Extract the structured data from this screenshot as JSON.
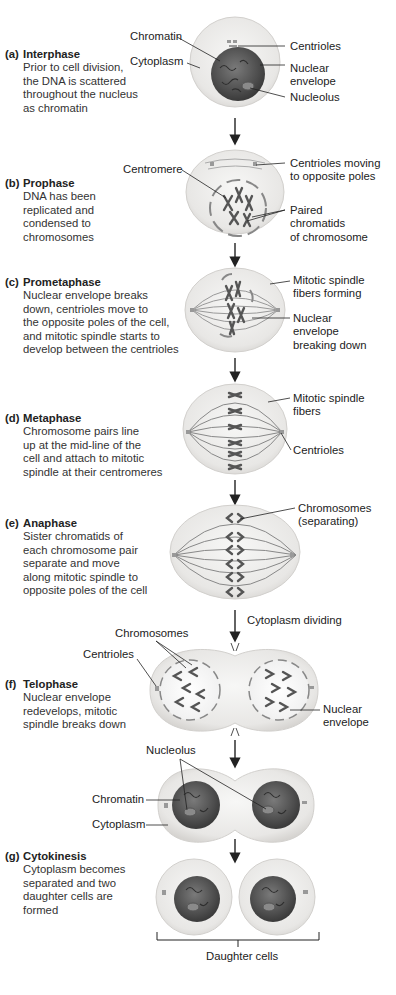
{
  "stages": [
    {
      "letter": "(a)",
      "name": "Interphase",
      "desc": [
        "Prior to cell division,",
        "the DNA is scattered",
        "throughout the nucleus",
        "as chromatin"
      ]
    },
    {
      "letter": "(b)",
      "name": "Prophase",
      "desc": [
        "DNA has been",
        "replicated and",
        "condensed to",
        "chromosomes"
      ]
    },
    {
      "letter": "(c)",
      "name": "Prometaphase",
      "desc": [
        "Nuclear envelope breaks",
        "down, centrioles move to",
        "the opposite poles of the cell,",
        "and mitotic spindle starts to",
        "develop between the centrioles"
      ]
    },
    {
      "letter": "(d)",
      "name": "Metaphase",
      "desc": [
        "Chromosome pairs line",
        "up at the mid-line of the",
        "cell and attach to mitotic",
        "spindle at their centromeres"
      ]
    },
    {
      "letter": "(e)",
      "name": "Anaphase",
      "desc": [
        "Sister chromatids of",
        "each chromosome pair",
        "separate and move",
        "along mitotic spindle to",
        "opposite poles of the cell"
      ]
    },
    {
      "letter": "(f)",
      "name": "Telophase",
      "desc": [
        "Nuclear envelope",
        "redevelops, mitotic",
        "spindle breaks down"
      ]
    },
    {
      "letter": "(g)",
      "name": "Cytokinesis",
      "desc": [
        "Cytoplasm becomes",
        "separated and two",
        "daughter cells are",
        "formed"
      ]
    }
  ],
  "labels": {
    "a_chromatin": "Chromatin",
    "a_cytoplasm": "Cytoplasm",
    "a_centrioles": "Centrioles",
    "a_nuclear_envelope": [
      "Nuclear",
      "envelope"
    ],
    "a_nucleolus": "Nucleolus",
    "b_centromere": "Centromere",
    "b_centrioles_moving": [
      "Centrioles moving",
      "to opposite poles"
    ],
    "b_paired": [
      "Paired",
      "chromatids",
      "of chromosome"
    ],
    "c_spindle": [
      "Mitotic spindle",
      "fibers forming"
    ],
    "c_envelope": [
      "Nuclear",
      "envelope",
      "breaking down"
    ],
    "d_spindle": [
      "Mitotic spindle",
      "fibers"
    ],
    "d_centrioles": "Centrioles",
    "e_chromosomes": [
      "Chromosomes",
      "(separating)"
    ],
    "cytoplasm_dividing": "Cytoplasm dividing",
    "f_chromosomes": "Chromosomes",
    "f_centrioles": "Centrioles",
    "f_envelope": [
      "Nuclear",
      "envelope"
    ],
    "g_nucleolus": "Nucleolus",
    "g_chromatin": "Chromatin",
    "g_cytoplasm": "Cytoplasm",
    "daughter_cells": "Daughter cells"
  },
  "colors": {
    "cytoplasm": "#ecebe9",
    "cell_edge": "#cfcdca",
    "nucleus_dark": "#4a4a4a",
    "chromosome": "#5a5a5a",
    "line": "#222222"
  }
}
